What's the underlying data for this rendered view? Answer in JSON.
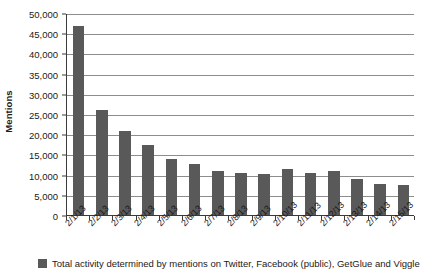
{
  "chart_data": {
    "type": "bar",
    "title": "",
    "xlabel": "",
    "ylabel": "Mentions",
    "ylim": [
      0,
      50000
    ],
    "ytick_step": 5000,
    "ytick_labels": [
      "50,000",
      "45,000",
      "40,000",
      "35,000",
      "30,000",
      "25,000",
      "20,000",
      "15,000",
      "10,000",
      "5,000",
      "0"
    ],
    "ytick_values": [
      50000,
      45000,
      40000,
      35000,
      30000,
      25000,
      20000,
      15000,
      10000,
      5000,
      0
    ],
    "grid": true,
    "legend_position": "bottom-left",
    "categories": [
      "2/1/13",
      "2/2/13",
      "2/3/13",
      "2/4/13",
      "2/5/13",
      "2/6/13",
      "2/7/13",
      "2/8/13",
      "2/9/13",
      "2/10/13",
      "2/11/13",
      "2/12/13",
      "2/13/13",
      "2/14/13",
      "2/15/13"
    ],
    "series": [
      {
        "name": "Total activity determined by mentions on Twitter, Facebook (public), GetGlue and Viggle",
        "color": "#595959",
        "values": [
          46800,
          26000,
          20900,
          17300,
          13900,
          12700,
          10900,
          10300,
          10200,
          11400,
          10400,
          10800,
          9000,
          7600,
          7400
        ]
      }
    ]
  },
  "axis": {
    "y_title": "Mentions"
  },
  "legend": {
    "swatch_color": "#595959",
    "label": "Total activity determined by mentions on Twitter, Facebook (public), GetGlue and Viggle"
  }
}
